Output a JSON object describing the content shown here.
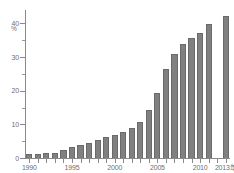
{
  "chart_data": {
    "type": "bar",
    "title": "",
    "subtitle": "",
    "xlabel": "",
    "ylabel": "",
    "unit_label": "%",
    "x_axis_suffix": "年",
    "categories": [
      "1990",
      "1991",
      "1992",
      "1993",
      "1994",
      "1995",
      "1996",
      "1997",
      "1998",
      "1999",
      "2000",
      "2001",
      "2002",
      "2003",
      "2004",
      "2005",
      "2006",
      "2007",
      "2008",
      "2009",
      "2010",
      "2011",
      "2012",
      "2013"
    ],
    "values": [
      1.2,
      1.3,
      1.4,
      1.6,
      2.4,
      3.4,
      3.9,
      4.4,
      5.5,
      6.3,
      6.9,
      7.7,
      9.0,
      10.8,
      14.2,
      19.2,
      26.6,
      30.9,
      34.0,
      35.7,
      37.3,
      39.9,
      null,
      42.2
    ],
    "ylim": [
      0,
      44
    ],
    "ytick_major": [
      0,
      10,
      20,
      30,
      40
    ],
    "ytick_minor": [
      5,
      15,
      25,
      35
    ],
    "ytick_labels": [
      "0",
      "10",
      "20",
      "30",
      "40"
    ],
    "xtick_labels": [
      {
        "category": "1990",
        "label": "1990"
      },
      {
        "category": "1995",
        "label": "1995"
      },
      {
        "category": "2000",
        "label": "2000"
      },
      {
        "category": "2005",
        "label": "2005"
      },
      {
        "category": "2010",
        "label": "2010"
      },
      {
        "category": "2013",
        "label": "2013年"
      }
    ],
    "grid": false,
    "legend": null,
    "bar_color": "#808080",
    "bar_edge_color": "#6a6a6a",
    "axis_color": "#8a8a8a",
    "text_color": "#6f6f6f"
  }
}
